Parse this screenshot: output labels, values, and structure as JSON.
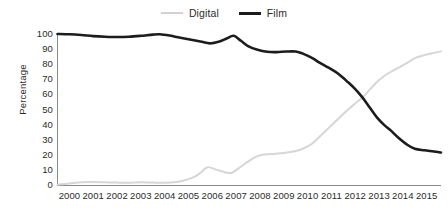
{
  "chart_data": {
    "type": "line",
    "title": "",
    "subtitle": "",
    "xlabel": "",
    "ylabel": "Percentage",
    "ylim": [
      0,
      100
    ],
    "xlim": [
      2000,
      2016.1
    ],
    "ytick_labels": [
      "100",
      "90",
      "80",
      "70",
      "60",
      "50",
      "40",
      "30",
      "20",
      "10",
      "0"
    ],
    "ytick_values": [
      100,
      90,
      80,
      70,
      60,
      50,
      40,
      30,
      20,
      10,
      0
    ],
    "xtick_labels": [
      "2000",
      "2001",
      "2002",
      "2003",
      "2004",
      "2005",
      "2006",
      "2007",
      "2008",
      "2009",
      "2010",
      "2011",
      "2012",
      "2013",
      "2014",
      "2015"
    ],
    "xtick_values": [
      2000,
      2001,
      2002,
      2003,
      2004,
      2005,
      2006,
      2007,
      2008,
      2009,
      2010,
      2011,
      2012,
      2013,
      2014,
      2015
    ],
    "grid": false,
    "legend_position": "top-center",
    "colors": {
      "digital": "#d6d6d6",
      "film": "#1c1c1c",
      "axis": "#8a8a8a",
      "text": "#2b2b2b",
      "background": "#ffffff"
    },
    "annotations": [
      "Film and Digital series cross at approximately 2012.7 at 57 percent"
    ],
    "series": [
      {
        "name": "Digital",
        "color": "#d6d6d6",
        "x": [
          2000.0,
          2000.5,
          2001.0,
          2001.5,
          2002.0,
          2002.5,
          2003.0,
          2003.5,
          2004.0,
          2004.5,
          2005.0,
          2005.3,
          2005.7,
          2006.0,
          2006.3,
          2006.7,
          2007.0,
          2007.3,
          2007.6,
          2008.0,
          2008.3,
          2008.6,
          2009.0,
          2009.5,
          2010.0,
          2010.3,
          2010.7,
          2011.0,
          2011.4,
          2011.8,
          2012.2,
          2012.5,
          2012.8,
          2013.1,
          2013.4,
          2013.7,
          2014.0,
          2014.3,
          2014.7,
          2015.0,
          2015.4,
          2015.8,
          2016.1
        ],
        "y": [
          0.3,
          1.0,
          1.8,
          2.0,
          1.8,
          1.6,
          1.5,
          1.8,
          1.6,
          1.5,
          2.0,
          3.0,
          5.0,
          8.0,
          11.8,
          10.0,
          8.6,
          8.0,
          11.0,
          15.5,
          18.5,
          20.0,
          20.5,
          21.2,
          22.5,
          24.0,
          27.5,
          32.0,
          38.0,
          44.0,
          50.0,
          54.0,
          58.0,
          63.0,
          68.0,
          72.0,
          75.0,
          77.5,
          81.0,
          84.0,
          86.0,
          87.5,
          88.5
        ]
      },
      {
        "name": "Film",
        "color": "#1c1c1c",
        "x": [
          2000.0,
          2000.5,
          2001.0,
          2001.5,
          2002.0,
          2002.5,
          2003.0,
          2003.5,
          2004.0,
          2004.3,
          2004.7,
          2005.0,
          2005.5,
          2006.0,
          2006.4,
          2006.8,
          2007.1,
          2007.4,
          2007.7,
          2008.0,
          2008.4,
          2008.8,
          2009.2,
          2009.6,
          2010.0,
          2010.3,
          2010.7,
          2011.0,
          2011.4,
          2011.8,
          2012.2,
          2012.5,
          2012.8,
          2013.1,
          2013.4,
          2013.7,
          2014.0,
          2014.3,
          2014.7,
          2015.0,
          2015.4,
          2015.8,
          2016.1
        ],
        "y": [
          100.0,
          99.8,
          99.3,
          98.6,
          98.2,
          98.0,
          98.2,
          98.8,
          99.6,
          99.8,
          99.0,
          98.0,
          96.5,
          95.0,
          93.8,
          95.0,
          97.0,
          98.8,
          95.5,
          92.0,
          89.5,
          88.2,
          88.0,
          88.4,
          88.4,
          87.0,
          84.0,
          81.0,
          77.5,
          73.5,
          68.0,
          63.5,
          58.0,
          51.5,
          45.0,
          40.0,
          36.0,
          31.5,
          26.5,
          24.0,
          23.0,
          22.2,
          21.5
        ]
      }
    ]
  },
  "legend": {
    "entries": [
      {
        "label": "Digital",
        "key": "digital"
      },
      {
        "label": "Film",
        "key": "film"
      }
    ]
  },
  "axes": {
    "y_title": "Percentage"
  }
}
